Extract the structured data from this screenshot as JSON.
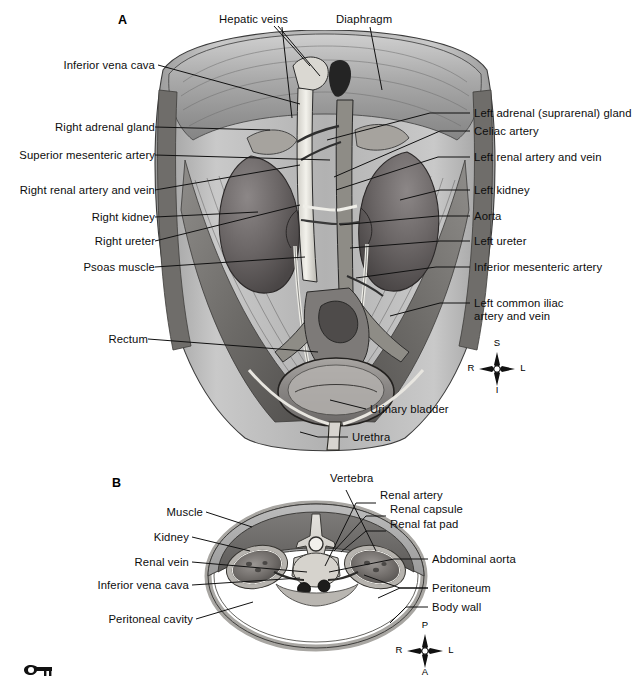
{
  "figure": {
    "panels": [
      {
        "id": "A",
        "letter": "A",
        "caption": "Anterior view of abdominal cavity showing urinary organs in situ"
      },
      {
        "id": "B",
        "letter": "B",
        "caption": "Transverse section of abdomen at level of kidneys"
      }
    ]
  },
  "panelA": {
    "letter": "A",
    "labels_left": [
      {
        "id": "inferior-vena-cava",
        "text": "Inferior vena cava"
      },
      {
        "id": "right-adrenal-gland",
        "text": "Right adrenal gland"
      },
      {
        "id": "superior-mesenteric-artery",
        "text": "Superior mesenteric artery"
      },
      {
        "id": "right-renal-artery-vein",
        "text": "Right renal artery and vein"
      },
      {
        "id": "right-kidney",
        "text": "Right kidney"
      },
      {
        "id": "right-ureter",
        "text": "Right ureter"
      },
      {
        "id": "psoas-muscle",
        "text": "Psoas muscle"
      },
      {
        "id": "rectum",
        "text": "Rectum"
      }
    ],
    "labels_top": [
      {
        "id": "hepatic-veins",
        "text": "Hepatic veins"
      },
      {
        "id": "diaphragm",
        "text": "Diaphragm"
      }
    ],
    "labels_right": [
      {
        "id": "left-adrenal-gland",
        "text": "Left adrenal (suprarenal) gland"
      },
      {
        "id": "celiac-artery",
        "text": "Celiac artery"
      },
      {
        "id": "left-renal-artery-vein",
        "text": "Left renal artery and vein"
      },
      {
        "id": "left-kidney",
        "text": "Left kidney"
      },
      {
        "id": "aorta",
        "text": "Aorta"
      },
      {
        "id": "left-ureter",
        "text": "Left ureter"
      },
      {
        "id": "inferior-mesenteric-artery",
        "text": "Inferior mesenteric artery"
      },
      {
        "id": "left-common-iliac-line1",
        "text": "Left common iliac"
      },
      {
        "id": "left-common-iliac-line2",
        "text": "artery and vein"
      }
    ],
    "labels_bottom": [
      {
        "id": "urinary-bladder",
        "text": "Urinary bladder"
      },
      {
        "id": "urethra",
        "text": "Urethra"
      }
    ],
    "compass": {
      "top": "S",
      "bottom": "I",
      "left": "R",
      "right": "L"
    }
  },
  "panelB": {
    "letter": "B",
    "labels_left": [
      {
        "id": "muscle",
        "text": "Muscle"
      },
      {
        "id": "kidney",
        "text": "Kidney"
      },
      {
        "id": "renal-vein",
        "text": "Renal vein"
      },
      {
        "id": "inferior-vena-cava",
        "text": "Inferior vena cava"
      },
      {
        "id": "peritoneal-cavity",
        "text": "Peritoneal cavity"
      }
    ],
    "labels_top": [
      {
        "id": "vertebra",
        "text": "Vertebra"
      }
    ],
    "labels_right": [
      {
        "id": "renal-artery",
        "text": "Renal artery"
      },
      {
        "id": "renal-capsule",
        "text": "Renal capsule"
      },
      {
        "id": "renal-fat-pad",
        "text": "Renal fat pad"
      },
      {
        "id": "abdominal-aorta",
        "text": "Abdominal aorta"
      },
      {
        "id": "peritoneum",
        "text": "Peritoneum"
      },
      {
        "id": "body-wall",
        "text": "Body wall"
      }
    ],
    "compass": {
      "top": "P",
      "bottom": "A",
      "left": "R",
      "right": "L"
    }
  },
  "footer": {
    "key_icon": "key-icon"
  },
  "colors": {
    "ink": "#0d0d0d",
    "paper": "#ffffff",
    "tissue_dark": "#5f5f5f",
    "tissue_mid": "#8a8a8a",
    "tissue_light": "#b9b9b9",
    "kidney": "#6e6a6a",
    "vessel": "#f0efe9",
    "bone": "#d9d7d2"
  }
}
